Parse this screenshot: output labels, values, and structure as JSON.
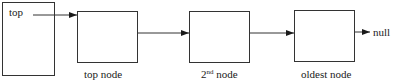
{
  "diagram": {
    "type": "linked-list-stack",
    "stack_pointer": {
      "label": "top"
    },
    "nodes": [
      {
        "id": "top-node",
        "label": "top node"
      },
      {
        "id": "second-node",
        "label_base": "2",
        "label_sup": "nd",
        "label_rest": " node"
      },
      {
        "id": "oldest-node",
        "label": "oldest node"
      }
    ],
    "terminator": {
      "label": "null"
    },
    "colors": {
      "stroke": "#333333",
      "text": "#1a1a1a",
      "background": "#ffffff"
    }
  }
}
